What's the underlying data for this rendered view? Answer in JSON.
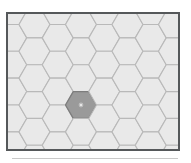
{
  "canvas": {
    "width": 191,
    "height": 163,
    "background": "#ffffff",
    "title": "Hexagonal grid map"
  },
  "frame": {
    "x": 6,
    "y": 12,
    "width": 174,
    "height": 139,
    "border_color": "#55585a",
    "border_width": 2,
    "interior_background": "#f2f2f2"
  },
  "hex_grid": {
    "orientation": "flat-top",
    "hex_radius": 15.5,
    "column_step": 23.25,
    "row_step": 26.85,
    "columns": 9,
    "rows": 7,
    "fill": "#e9e9e9",
    "stroke": "#b9b9b9",
    "stroke_width": 1.1,
    "highlight_fill": "#9a9a9a",
    "highlight_stroke": "#7d7d7d"
  },
  "selection": {
    "label": "selected-hex",
    "column": 3,
    "row": 3,
    "center_x": 81,
    "center_y": 105,
    "fill": "#9a9a9a"
  },
  "cursor": {
    "label": "pointer",
    "x": 81,
    "y": 105,
    "color": "#d8d8d8"
  },
  "bottom_rule": {
    "x": 12,
    "y": 158,
    "width": 166,
    "color": "#c9c9c9"
  }
}
